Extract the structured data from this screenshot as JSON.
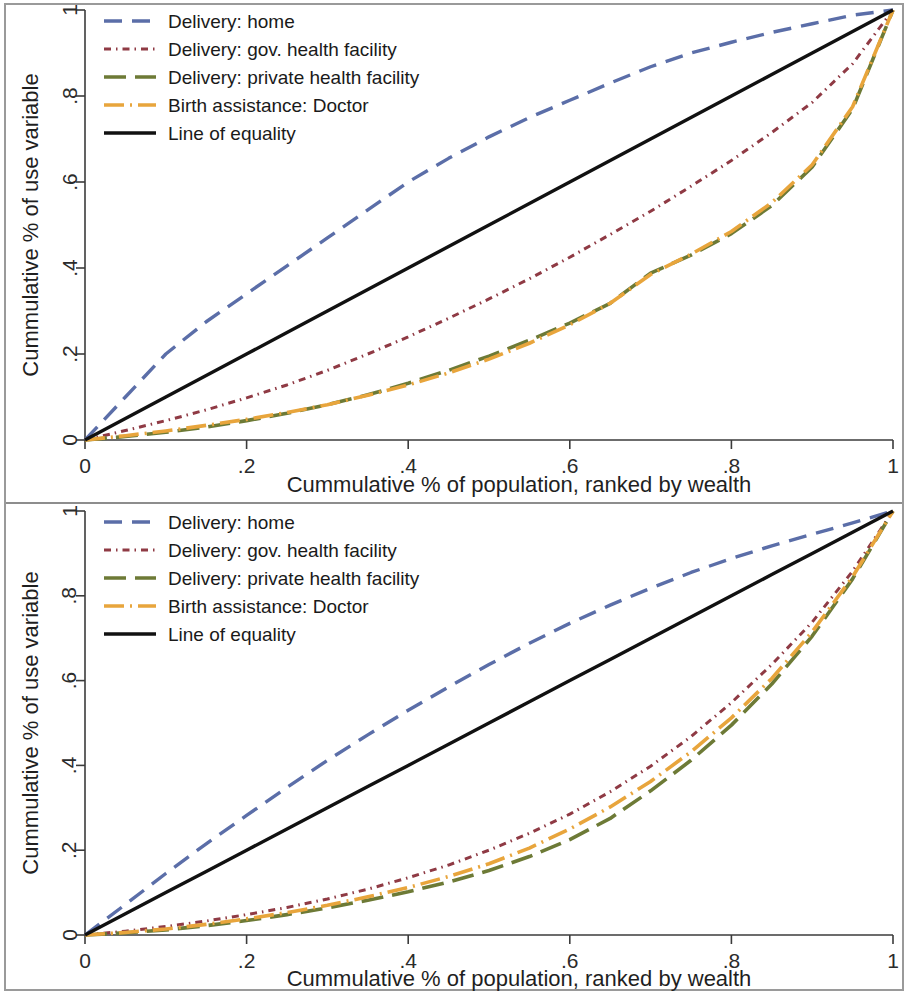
{
  "figure": {
    "background_color": "#ffffff",
    "frame_color": "#9a9a9a",
    "panel_count": 2
  },
  "axes": {
    "x_title": "Cummulative % of population, ranked by wealth",
    "y_title": "Cummulative % of use variable",
    "x_ticks": [
      "0",
      ".2",
      ".4",
      ".6",
      ".8",
      "1"
    ],
    "y_ticks": [
      "0",
      ".2",
      ".4",
      ".6",
      ".8",
      "1"
    ],
    "x_tick_values": [
      0,
      0.2,
      0.4,
      0.6,
      0.8,
      1
    ],
    "y_tick_values": [
      0,
      0.2,
      0.4,
      0.6,
      0.8,
      1
    ],
    "xlim": [
      0,
      1
    ],
    "ylim": [
      0,
      1
    ],
    "grid": false
  },
  "legend": {
    "position": "upper-left",
    "entries": [
      {
        "label": "Delivery: home",
        "color": "#5b6ea8",
        "dash": "18,10",
        "width": 3.4
      },
      {
        "label": "Delivery: gov. health facility",
        "color": "#8f3a44",
        "dash": "7,5,1.5,5",
        "width": 3.0
      },
      {
        "label": "Delivery: private health facility",
        "color": "#6d7a36",
        "dash": "22,9",
        "width": 3.6
      },
      {
        "label": "Birth assistance: Doctor",
        "color": "#e8a53c",
        "dash": "20,6,2,6",
        "width": 3.6
      },
      {
        "label": "Line of equality",
        "color": "#111111",
        "dash": "none",
        "width": 3.4
      }
    ]
  },
  "chart_data": [
    {
      "id": "panel-top",
      "type": "line",
      "title": "",
      "subtitle": "",
      "xlabel": "Cummulative % of population, ranked by wealth",
      "ylabel": "Cummulative % of use variable",
      "xlim": [
        0,
        1
      ],
      "ylim": [
        0,
        1
      ],
      "grid": false,
      "legend_position": "upper-left",
      "x": [
        0,
        0.05,
        0.1,
        0.15,
        0.2,
        0.25,
        0.3,
        0.35,
        0.4,
        0.45,
        0.5,
        0.55,
        0.6,
        0.65,
        0.7,
        0.75,
        0.8,
        0.85,
        0.9,
        0.95,
        1
      ],
      "series": [
        {
          "name": "Delivery: home",
          "color": "#5b6ea8",
          "values": [
            0,
            0.1,
            0.2,
            0.275,
            0.34,
            0.405,
            0.47,
            0.535,
            0.6,
            0.655,
            0.705,
            0.75,
            0.79,
            0.83,
            0.868,
            0.9,
            0.925,
            0.948,
            0.968,
            0.988,
            1
          ]
        },
        {
          "name": "Delivery: gov. health facility",
          "color": "#8f3a44",
          "values": [
            0,
            0.022,
            0.045,
            0.07,
            0.098,
            0.128,
            0.162,
            0.2,
            0.24,
            0.283,
            0.328,
            0.375,
            0.425,
            0.478,
            0.532,
            0.59,
            0.65,
            0.715,
            0.785,
            0.875,
            1
          ]
        },
        {
          "name": "Delivery: private health facility",
          "color": "#6d7a36",
          "values": [
            0,
            0.008,
            0.018,
            0.03,
            0.045,
            0.062,
            0.082,
            0.105,
            0.132,
            0.162,
            0.195,
            0.232,
            0.272,
            0.318,
            0.388,
            0.43,
            0.48,
            0.545,
            0.635,
            0.77,
            1
          ]
        },
        {
          "name": "Birth assistance: Doctor",
          "color": "#e8a53c",
          "values": [
            0,
            0.01,
            0.021,
            0.034,
            0.048,
            0.064,
            0.082,
            0.104,
            0.128,
            0.156,
            0.188,
            0.225,
            0.268,
            0.318,
            0.385,
            0.432,
            0.485,
            0.552,
            0.64,
            0.775,
            1
          ]
        },
        {
          "name": "Line of equality",
          "color": "#111111",
          "values": [
            0,
            0.05,
            0.1,
            0.15,
            0.2,
            0.25,
            0.3,
            0.35,
            0.4,
            0.45,
            0.5,
            0.55,
            0.6,
            0.65,
            0.7,
            0.75,
            0.8,
            0.85,
            0.9,
            0.95,
            1
          ]
        }
      ]
    },
    {
      "id": "panel-bottom",
      "type": "line",
      "title": "",
      "subtitle": "",
      "xlabel": "Cummulative % of population, ranked by wealth",
      "ylabel": "Cummulative % of use variable",
      "xlim": [
        0,
        1
      ],
      "ylim": [
        0,
        1
      ],
      "grid": false,
      "legend_position": "upper-left",
      "x": [
        0,
        0.05,
        0.1,
        0.15,
        0.2,
        0.25,
        0.3,
        0.35,
        0.4,
        0.45,
        0.5,
        0.55,
        0.6,
        0.65,
        0.7,
        0.75,
        0.8,
        0.85,
        0.9,
        0.95,
        1
      ],
      "series": [
        {
          "name": "Delivery: home",
          "color": "#5b6ea8",
          "values": [
            0,
            0.072,
            0.145,
            0.215,
            0.282,
            0.348,
            0.412,
            0.472,
            0.53,
            0.585,
            0.638,
            0.688,
            0.735,
            0.778,
            0.818,
            0.855,
            0.888,
            0.918,
            0.945,
            0.972,
            1
          ]
        },
        {
          "name": "Delivery: gov. health facility",
          "color": "#8f3a44",
          "values": [
            0,
            0.009,
            0.02,
            0.033,
            0.048,
            0.065,
            0.085,
            0.108,
            0.135,
            0.165,
            0.2,
            0.24,
            0.285,
            0.338,
            0.398,
            0.468,
            0.548,
            0.638,
            0.738,
            0.858,
            1
          ]
        },
        {
          "name": "Delivery: private health facility",
          "color": "#6d7a36",
          "values": [
            0,
            0.005,
            0.012,
            0.022,
            0.034,
            0.048,
            0.064,
            0.082,
            0.102,
            0.125,
            0.152,
            0.185,
            0.225,
            0.275,
            0.34,
            0.412,
            0.495,
            0.592,
            0.705,
            0.84,
            1
          ]
        },
        {
          "name": "Birth assistance: Doctor",
          "color": "#e8a53c",
          "values": [
            0,
            0.006,
            0.014,
            0.025,
            0.038,
            0.053,
            0.07,
            0.09,
            0.112,
            0.138,
            0.168,
            0.205,
            0.25,
            0.302,
            0.362,
            0.432,
            0.512,
            0.605,
            0.715,
            0.845,
            1
          ]
        },
        {
          "name": "Line of equality",
          "color": "#111111",
          "values": [
            0,
            0.05,
            0.1,
            0.15,
            0.2,
            0.25,
            0.3,
            0.35,
            0.4,
            0.45,
            0.5,
            0.55,
            0.6,
            0.65,
            0.7,
            0.75,
            0.8,
            0.85,
            0.9,
            0.95,
            1
          ]
        }
      ]
    }
  ]
}
